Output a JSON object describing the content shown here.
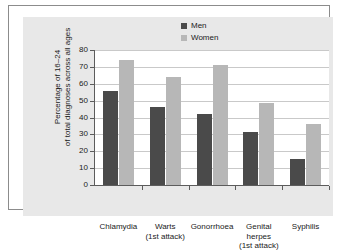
{
  "chart_data": {
    "type": "bar",
    "title": "",
    "xlabel": "",
    "ylabel": "Percentage of 16–24 of total diagnoses across all ages",
    "ylabel_line1": "Percentage of 16–24",
    "ylabel_line2": "of total diagnoses across all ages",
    "ylim": [
      0,
      80
    ],
    "ytick_labels": [
      "0",
      "10",
      "20",
      "30",
      "40",
      "50",
      "60",
      "70",
      "80"
    ],
    "ytick_values": [
      0,
      10,
      20,
      30,
      40,
      50,
      60,
      70,
      80
    ],
    "grid": true,
    "legend_position": "top-right",
    "categories": [
      "Chlamydia",
      "Warts",
      "Gonorrhoea",
      "Genital herpes",
      "Syphilis"
    ],
    "category_labels": [
      {
        "line1": "Chlamydia",
        "line2": "",
        "line3": ""
      },
      {
        "line1": "Warts",
        "line2": "(1st attack)",
        "line3": ""
      },
      {
        "line1": "Gonorrhoea",
        "line2": "",
        "line3": ""
      },
      {
        "line1": "Genital",
        "line2": "herpes",
        "line3": "(1st attack)"
      },
      {
        "line1": "Syphilis",
        "line2": "",
        "line3": ""
      }
    ],
    "series": [
      {
        "name": "Men",
        "color": "#4a4a4a",
        "values": [
          56,
          46.5,
          42,
          31.5,
          15.5
        ]
      },
      {
        "name": "Women",
        "color": "#b7b7b7",
        "values": [
          74,
          64,
          71,
          48.5,
          36
        ]
      }
    ]
  },
  "legend": {
    "items": [
      {
        "label": "Men",
        "color": "#4a4a4a"
      },
      {
        "label": "Women",
        "color": "#b7b7b7"
      }
    ]
  },
  "colors": {
    "men_bar": "#4a4a4a",
    "women_bar": "#b7b7b7",
    "panel_background": "#e8e8e8",
    "plot_background": "#ffffff",
    "axis": "#5c5c5c",
    "gridline": "#c9c9c9",
    "text": "#1a1a1a"
  }
}
